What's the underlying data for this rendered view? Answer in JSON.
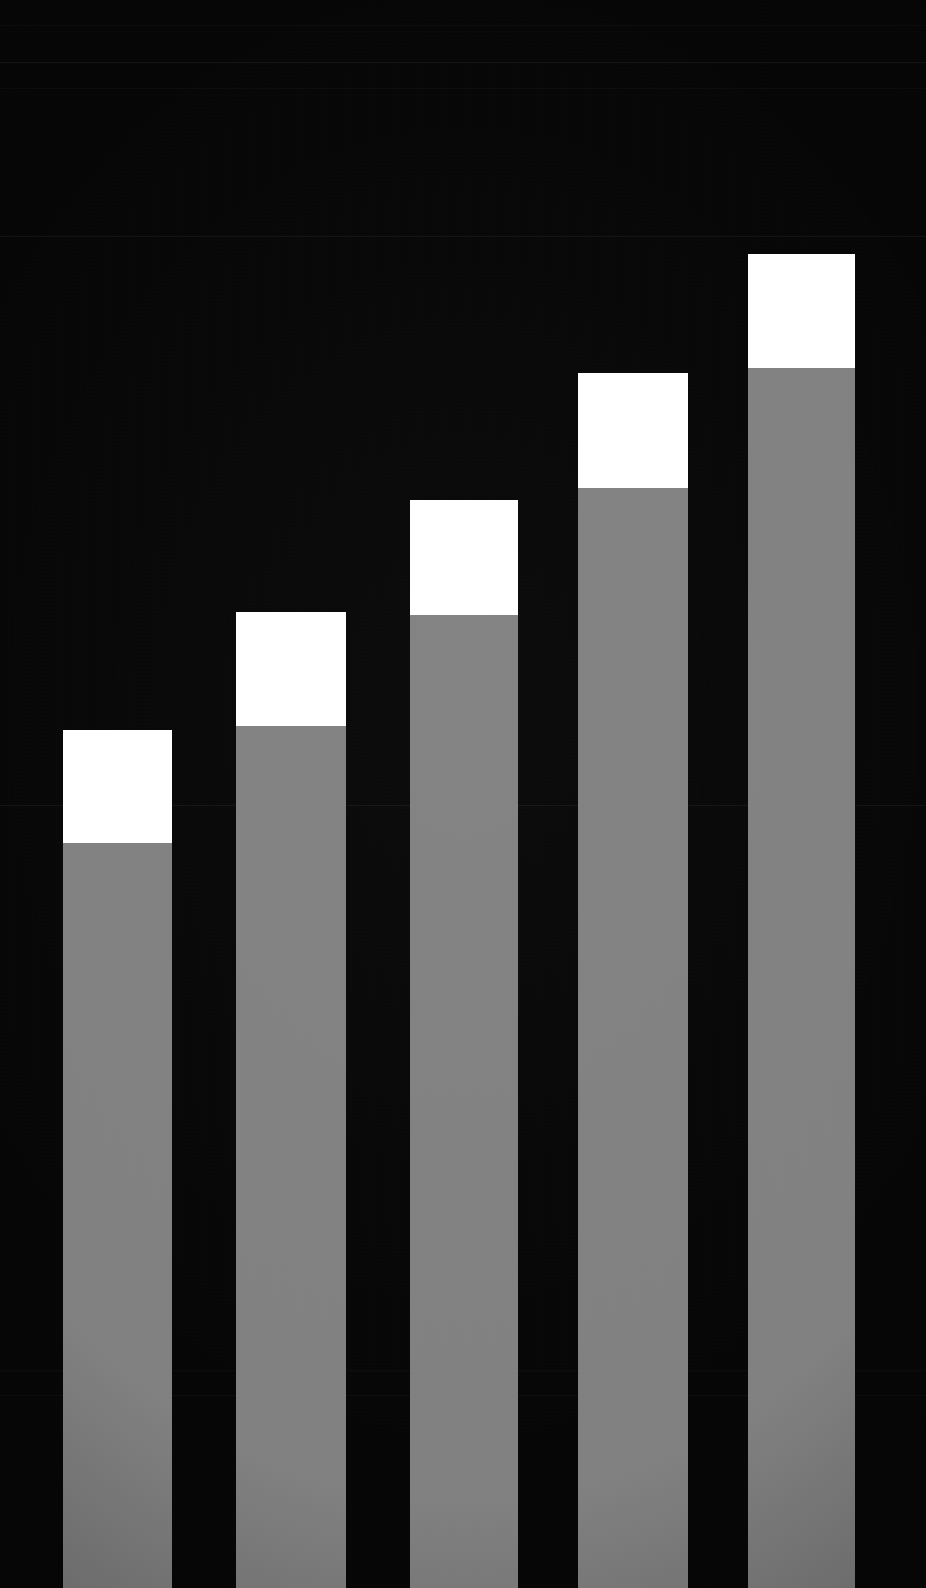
{
  "figure": {
    "kind": "bar-chart-crop",
    "background_color": "#050505",
    "width_px": 926,
    "height_px": 1588,
    "title": "",
    "subtitle": "",
    "description": "Close-up crop of a dark-themed stacked bar chart: five ascending bars, each with a gray lower segment and a white upper cap segment, over faint horizontal gridlines."
  },
  "colors": {
    "background": "#050505",
    "base_segment": "#808080",
    "cap_segment": "#FFFFFF",
    "gridline": "#FFFFFF"
  },
  "chart_data": {
    "type": "bar",
    "title": "",
    "subtitle": "",
    "xlabel": "",
    "ylabel": "",
    "categories": [
      "1",
      "2",
      "3",
      "4",
      "5"
    ],
    "stacked": true,
    "grid": true,
    "legend_position": "none",
    "axis_labels_visible": false,
    "tick_labels_visible": false,
    "ylim": [
      0,
      1588
    ],
    "series": [
      {
        "name": "base",
        "color": "#808080",
        "values": [
          745,
          862,
          973,
          1100,
          1220
        ]
      },
      {
        "name": "cap",
        "color": "#FFFFFF",
        "values": [
          113,
          114,
          115,
          115,
          114
        ]
      }
    ],
    "bars": [
      {
        "index": 1,
        "label": "1",
        "left_px": 63,
        "right_px": 172,
        "width_px": 109,
        "cap_top_px": 730,
        "cap_bottom_px": 843,
        "base_top_px": 843,
        "base_bottom_px": 1588,
        "cap_height_px": 113,
        "base_height_px": 745,
        "total_height_px": 858
      },
      {
        "index": 2,
        "label": "2",
        "left_px": 236,
        "right_px": 346,
        "width_px": 110,
        "cap_top_px": 612,
        "cap_bottom_px": 726,
        "base_top_px": 726,
        "base_bottom_px": 1588,
        "cap_height_px": 114,
        "base_height_px": 862,
        "total_height_px": 976
      },
      {
        "index": 3,
        "label": "3",
        "left_px": 410,
        "right_px": 518,
        "width_px": 108,
        "cap_top_px": 500,
        "cap_bottom_px": 615,
        "base_top_px": 615,
        "base_bottom_px": 1588,
        "cap_height_px": 115,
        "base_height_px": 973,
        "total_height_px": 1088
      },
      {
        "index": 4,
        "label": "4",
        "left_px": 578,
        "right_px": 688,
        "width_px": 110,
        "cap_top_px": 373,
        "cap_bottom_px": 488,
        "base_top_px": 488,
        "base_bottom_px": 1588,
        "cap_height_px": 115,
        "base_height_px": 1100,
        "total_height_px": 1215
      },
      {
        "index": 5,
        "label": "5",
        "left_px": 748,
        "right_px": 855,
        "width_px": 107,
        "cap_top_px": 254,
        "cap_bottom_px": 368,
        "base_top_px": 368,
        "base_bottom_px": 1588,
        "cap_height_px": 114,
        "base_height_px": 1220,
        "total_height_px": 1334
      }
    ],
    "gridlines_y_px": [
      25,
      62,
      88,
      236,
      805,
      1370,
      1395
    ]
  },
  "accessibility": {
    "chart_role_label": "stacked bar chart",
    "bar_role_label": "bar"
  }
}
